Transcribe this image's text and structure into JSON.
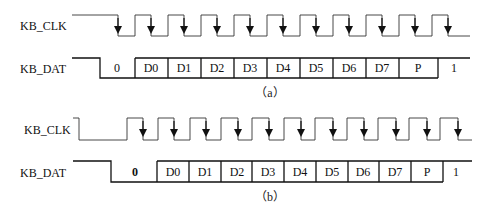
{
  "diagrams": [
    {
      "id": "a",
      "caption": "（a）",
      "clk_label": "KB_CLK",
      "dat_label": "KB_DAT",
      "cells": [
        "0",
        "D0",
        "D1",
        "D2",
        "D3",
        "D4",
        "D5",
        "D6",
        "D7",
        "P",
        "1"
      ],
      "clock_falling_edges": 11,
      "description": "Device-to-host: data valid on falling edge of clock"
    },
    {
      "id": "b",
      "caption": "（b）",
      "clk_label": "KB_CLK",
      "dat_label": "KB_DAT",
      "cells": [
        "0",
        "D0",
        "D1",
        "D2",
        "D3",
        "D4",
        "D5",
        "D6",
        "D7",
        "P",
        "1"
      ],
      "clock_falling_edges": 11,
      "description": "Host-to-device: host pulls clock low, then data, then releases clock"
    }
  ]
}
